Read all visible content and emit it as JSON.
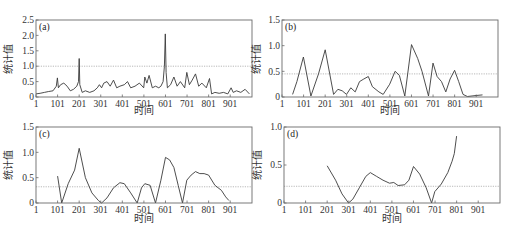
{
  "chart_data": [
    {
      "panel": "(a)",
      "type": "line",
      "xlabel": "时间",
      "ylabel": "统计值",
      "xticks": [
        "1",
        "101",
        "201",
        "301",
        "401",
        "501",
        "601",
        "701",
        "801",
        "901"
      ],
      "yticks": [
        "0",
        "0.5",
        "1.0",
        "1.5",
        "2.0",
        "2.5"
      ],
      "xlim": [
        1,
        1000
      ],
      "ylim": [
        0,
        2.5
      ],
      "threshold": 1.0,
      "x": [
        1,
        20,
        40,
        60,
        80,
        95,
        100,
        105,
        115,
        130,
        145,
        160,
        175,
        190,
        198,
        201,
        204,
        215,
        230,
        250,
        270,
        285,
        295,
        305,
        315,
        330,
        345,
        360,
        375,
        390,
        410,
        425,
        440,
        460,
        480,
        500,
        505,
        515,
        525,
        540,
        555,
        570,
        580,
        590,
        596,
        600,
        604,
        610,
        625,
        640,
        655,
        670,
        690,
        700,
        712,
        725,
        740,
        755,
        770,
        790,
        805,
        815,
        830,
        850,
        870,
        890,
        905,
        915,
        930,
        950,
        970,
        990
      ],
      "values": [
        0.1,
        0.12,
        0.15,
        0.18,
        0.2,
        0.35,
        0.62,
        0.3,
        0.4,
        0.45,
        0.35,
        0.2,
        0.25,
        0.35,
        0.5,
        1.25,
        0.4,
        0.15,
        0.2,
        0.15,
        0.2,
        0.3,
        0.4,
        0.3,
        0.45,
        0.5,
        0.35,
        0.55,
        0.3,
        0.35,
        0.4,
        0.5,
        0.3,
        0.35,
        0.45,
        0.3,
        0.65,
        0.45,
        0.7,
        0.3,
        0.35,
        0.3,
        0.35,
        0.5,
        1.0,
        2.05,
        0.8,
        0.3,
        0.4,
        0.65,
        0.35,
        0.5,
        0.3,
        0.8,
        0.4,
        0.55,
        0.75,
        0.35,
        0.45,
        0.3,
        0.6,
        0.1,
        0.15,
        0.12,
        0.15,
        0.1,
        0.3,
        0.15,
        0.2,
        0.15,
        0.25,
        0.1
      ]
    },
    {
      "panel": "(b)",
      "type": "line",
      "xlabel": "时间",
      "ylabel": "统计值",
      "xticks": [
        "1",
        "101",
        "201",
        "301",
        "401",
        "501",
        "601",
        "701",
        "801",
        "901"
      ],
      "yticks": [
        "0",
        "0.5",
        "1.0",
        "1.5"
      ],
      "xlim": [
        1,
        1000
      ],
      "ylim": [
        0,
        1.5
      ],
      "threshold": 0.45,
      "x": [
        50,
        70,
        100,
        135,
        170,
        201,
        240,
        260,
        280,
        300,
        320,
        340,
        360,
        380,
        401,
        420,
        450,
        470,
        500,
        525,
        545,
        570,
        601,
        630,
        650,
        680,
        701,
        720,
        740,
        760,
        780,
        801,
        820,
        840,
        860,
        900,
        930
      ],
      "values": [
        0.05,
        0.3,
        0.78,
        0.02,
        0.45,
        0.92,
        0.05,
        0.15,
        0.12,
        0.05,
        0.18,
        0.1,
        0.3,
        0.35,
        0.4,
        0.2,
        0.1,
        0.05,
        0.25,
        0.5,
        0.42,
        0.02,
        1.02,
        0.75,
        0.5,
        0.02,
        0.66,
        0.4,
        0.3,
        0.1,
        0.35,
        0.52,
        0.3,
        0.05,
        0.01,
        0.03,
        0.04
      ]
    },
    {
      "panel": "(c)",
      "type": "line",
      "xlabel": "时间",
      "ylabel": "统计值",
      "xticks": [
        "1",
        "101",
        "201",
        "301",
        "401",
        "501",
        "601",
        "701",
        "801",
        "901"
      ],
      "yticks": [
        "0",
        "0.5",
        "1.0",
        "1.5"
      ],
      "xlim": [
        1,
        1000
      ],
      "ylim": [
        0,
        1.5
      ],
      "threshold": 0.32,
      "x": [
        101,
        120,
        150,
        180,
        201,
        230,
        260,
        290,
        305,
        330,
        360,
        390,
        410,
        440,
        470,
        490,
        505,
        530,
        555,
        580,
        601,
        620,
        640,
        660,
        680,
        700,
        720,
        740,
        760,
        780,
        801,
        830,
        860,
        880,
        895
      ],
      "values": [
        0.53,
        0.0,
        0.38,
        0.65,
        1.08,
        0.5,
        0.2,
        0.05,
        0.0,
        0.1,
        0.3,
        0.4,
        0.38,
        0.2,
        0.0,
        0.3,
        0.38,
        0.35,
        0.0,
        0.45,
        0.9,
        0.85,
        0.7,
        0.35,
        0.0,
        0.45,
        0.55,
        0.62,
        0.58,
        0.58,
        0.55,
        0.35,
        0.25,
        0.12,
        0.05
      ]
    },
    {
      "panel": "(d)",
      "type": "line",
      "xlabel": "时间",
      "ylabel": "统计值",
      "xticks": [
        "1",
        "101",
        "201",
        "301",
        "401",
        "501",
        "601",
        "701",
        "801",
        "901"
      ],
      "yticks": [
        "0",
        "0.5",
        "1.0"
      ],
      "xlim": [
        1,
        1000
      ],
      "ylim": [
        0,
        1.0
      ],
      "threshold": 0.22,
      "x": [
        201,
        240,
        270,
        300,
        320,
        350,
        380,
        401,
        430,
        460,
        490,
        510,
        530,
        560,
        580,
        601,
        630,
        660,
        685,
        700,
        730,
        760,
        780,
        790,
        801
      ],
      "values": [
        0.49,
        0.3,
        0.12,
        0.0,
        0.05,
        0.2,
        0.35,
        0.4,
        0.35,
        0.3,
        0.26,
        0.27,
        0.23,
        0.24,
        0.3,
        0.48,
        0.38,
        0.2,
        0.0,
        0.15,
        0.25,
        0.4,
        0.55,
        0.65,
        0.88
      ]
    }
  ]
}
